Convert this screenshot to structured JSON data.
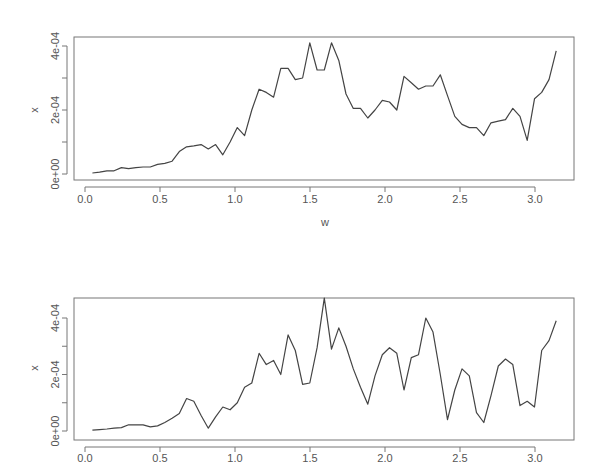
{
  "chart_data": [
    {
      "type": "line",
      "title": "",
      "xlabel": "w",
      "ylabel": "x",
      "xlim": [
        -0.08,
        3.26
      ],
      "ylim": [
        -1.5e-05,
        0.00043
      ],
      "xticks": [
        0.0,
        0.5,
        1.0,
        1.5,
        2.0,
        2.5,
        3.0
      ],
      "xtick_labels": [
        "0.0",
        "0.5",
        "1.0",
        "1.5",
        "2.0",
        "2.5",
        "3.0"
      ],
      "yticks": [
        0,
        0.0001,
        0.0002,
        0.0003,
        0.0004
      ],
      "ytick_labels": [
        "0e+00",
        "",
        "2e-04",
        "",
        "4e-04"
      ],
      "grid": false,
      "legend": null,
      "x_step": 0.0490874,
      "n_points": 64,
      "values_e4": [
        0.03,
        0.06,
        0.1,
        0.1,
        0.2,
        0.17,
        0.2,
        0.22,
        0.22,
        0.3,
        0.33,
        0.4,
        0.7,
        0.85,
        0.88,
        0.92,
        0.78,
        0.92,
        0.6,
        1.0,
        1.45,
        1.2,
        2.0,
        2.65,
        2.55,
        2.4,
        3.3,
        3.3,
        2.95,
        3.0,
        4.1,
        3.25,
        3.25,
        4.1,
        3.55,
        2.5,
        2.05,
        2.05,
        1.75,
        2.0,
        2.3,
        2.25,
        2.0,
        3.05,
        2.85,
        2.65,
        2.75,
        2.75,
        3.1,
        2.45,
        1.8,
        1.55,
        1.45,
        1.45,
        1.2,
        1.6,
        1.65,
        1.7,
        2.05,
        1.8,
        1.05,
        2.35,
        2.55,
        2.95
      ],
      "tail_values_e4": [
        3.85
      ]
    },
    {
      "type": "line",
      "title": "",
      "xlabel": "",
      "ylabel": "x",
      "xlim": [
        -0.08,
        3.26
      ],
      "ylim": [
        -1.5e-05,
        0.00048
      ],
      "xticks": [
        0.0,
        0.5,
        1.0,
        1.5,
        2.0,
        2.5,
        3.0
      ],
      "xtick_labels": [
        "0.0",
        "0.5",
        "1.0",
        "1.5",
        "2.0",
        "2.5",
        "3.0"
      ],
      "yticks": [
        0,
        0.0001,
        0.0002,
        0.0003,
        0.0004
      ],
      "ytick_labels": [
        "0e+00",
        "",
        "2e-04",
        "",
        "4e-04"
      ],
      "grid": false,
      "legend": null,
      "x_step": 0.0490874,
      "n_points": 64,
      "values_e4": [
        0.03,
        0.05,
        0.07,
        0.1,
        0.12,
        0.22,
        0.22,
        0.22,
        0.15,
        0.18,
        0.3,
        0.45,
        0.62,
        1.15,
        1.05,
        0.55,
        0.1,
        0.5,
        0.85,
        0.75,
        1.0,
        1.55,
        1.7,
        2.75,
        2.35,
        2.5,
        2.0,
        3.4,
        2.85,
        1.65,
        1.7,
        2.95,
        4.7,
        2.9,
        3.65,
        3.0,
        2.2,
        1.55,
        0.95,
        1.95,
        2.7,
        2.95,
        2.75,
        1.45,
        2.6,
        2.7,
        4.0,
        3.5,
        2.0,
        0.4,
        1.45,
        2.2,
        1.95,
        0.65,
        0.3,
        1.25,
        2.3,
        2.55,
        2.35,
        0.9,
        1.05,
        0.85,
        2.85,
        3.2
      ],
      "tail_values_e4": [
        3.9
      ]
    }
  ],
  "plots": {
    "top": {
      "ylabel": "x",
      "xlabel": "w"
    },
    "bottom": {
      "ylabel": "x",
      "xlabel": ""
    }
  }
}
